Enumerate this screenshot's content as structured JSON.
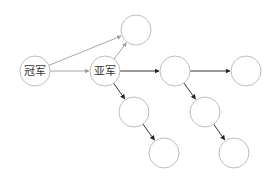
{
  "diagram": {
    "type": "directed-graph",
    "nodes": [
      {
        "id": "champion",
        "label": "冠军",
        "cx": 35,
        "cy": 71
      },
      {
        "id": "runner_up",
        "label": "亚军",
        "cx": 105,
        "cy": 71
      },
      {
        "id": "top",
        "label": "",
        "cx": 136,
        "cy": 30
      },
      {
        "id": "row_1",
        "label": "",
        "cx": 175,
        "cy": 71
      },
      {
        "id": "row_2",
        "label": "",
        "cx": 246,
        "cy": 71
      },
      {
        "id": "ru_down_1",
        "label": "",
        "cx": 134,
        "cy": 112
      },
      {
        "id": "ru_down_2",
        "label": "",
        "cx": 164,
        "cy": 153
      },
      {
        "id": "r1_down_1",
        "label": "",
        "cx": 205,
        "cy": 112
      },
      {
        "id": "r1_down_2",
        "label": "",
        "cx": 234,
        "cy": 153
      }
    ],
    "edges": [
      {
        "from": "champion",
        "to": "top",
        "style": "light"
      },
      {
        "from": "champion",
        "to": "runner_up",
        "style": "light"
      },
      {
        "from": "runner_up",
        "to": "top",
        "style": "light"
      },
      {
        "from": "runner_up",
        "to": "row_1",
        "style": "dark"
      },
      {
        "from": "row_1",
        "to": "row_2",
        "style": "dark"
      },
      {
        "from": "runner_up",
        "to": "ru_down_1",
        "style": "dark"
      },
      {
        "from": "ru_down_1",
        "to": "ru_down_2",
        "style": "dark"
      },
      {
        "from": "row_1",
        "to": "r1_down_1",
        "style": "dark"
      },
      {
        "from": "r1_down_1",
        "to": "r1_down_2",
        "style": "dark"
      }
    ],
    "radius": 15,
    "colors": {
      "node_stroke": "#bdbdbd",
      "edge_light": "#9e9e9e",
      "edge_dark": "#333333",
      "text": "#333333"
    }
  }
}
